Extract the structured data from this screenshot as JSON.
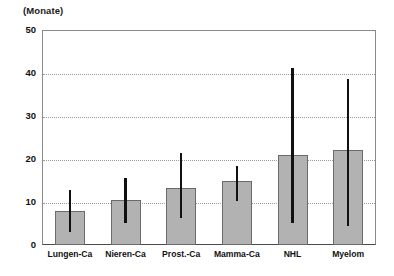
{
  "chart_data": {
    "type": "bar",
    "title": "(Monate)",
    "xlabel": "",
    "ylabel": "(Monate)",
    "ylim": [
      0,
      50
    ],
    "yticks": [
      0,
      10,
      20,
      30,
      40,
      50
    ],
    "grid": true,
    "legend": null,
    "categories": [
      "Lungen-Ca",
      "Nieren-Ca",
      "Prost.-Ca",
      "Mamma-Ca",
      "NHL",
      "Myelom"
    ],
    "values": [
      8,
      10.5,
      13.2,
      14.9,
      21,
      22
    ],
    "error_bars": {
      "lower": [
        3,
        5,
        6.3,
        10.2,
        5,
        4.5
      ],
      "upper": [
        12.7,
        15.6,
        21.5,
        18.3,
        41.2,
        38.5
      ]
    },
    "series": [
      {
        "name": "Median",
        "values": [
          8,
          10.5,
          13.2,
          14.9,
          21,
          22
        ]
      }
    ],
    "colors": {
      "bar_fill": "#b2b2b2",
      "bar_edge": "#6b6b6b",
      "error_bar": "#111111",
      "gridline": "#9a9a9a",
      "frame": "#8a8a8a",
      "axis": "#4a4a4a",
      "text": "#111111",
      "background": "#ffffff"
    }
  },
  "axis": {
    "y_title": "(Monate)",
    "tick_labels": [
      "0",
      "10",
      "20",
      "30",
      "40",
      "50"
    ]
  }
}
